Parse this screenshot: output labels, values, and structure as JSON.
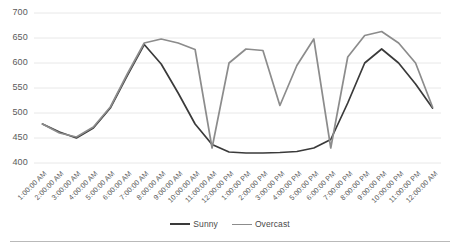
{
  "chart_data": {
    "type": "line",
    "title": "",
    "xlabel": "",
    "ylabel": "",
    "ylim": [
      400,
      700
    ],
    "yticks": [
      400,
      450,
      500,
      550,
      600,
      650,
      700
    ],
    "grid": true,
    "legend_position": "bottom",
    "categories": [
      "1:00:00 AM",
      "2:00:00 AM",
      "3:00:00 AM",
      "4:00:00 AM",
      "5:00:00 AM",
      "6:00:00 AM",
      "7:00:00 AM",
      "8:00:00 AM",
      "9:00:00 AM",
      "10:00:00 AM",
      "11:00:00 AM",
      "12:00:00 PM",
      "1:00:00 PM",
      "2:00:00 PM",
      "3:00:00 PM",
      "4:00:00 PM",
      "5:00:00 PM",
      "6:00:00 PM",
      "7:00:00 PM",
      "8:00:00 PM",
      "9:00:00 PM",
      "10:00:00 PM",
      "11:00:00 PM",
      "12:00:00 AM"
    ],
    "series": [
      {
        "name": "Sunny",
        "color": "#3a3a3a",
        "values": [
          478,
          462,
          450,
          470,
          510,
          575,
          637,
          598,
          540,
          478,
          437,
          422,
          420,
          420,
          421,
          423,
          430,
          447,
          520,
          600,
          628,
          600,
          558,
          510
        ]
      },
      {
        "name": "Overcast",
        "color": "#8c8c8c",
        "values": [
          478,
          460,
          452,
          472,
          512,
          578,
          640,
          648,
          640,
          627,
          430,
          600,
          628,
          625,
          515,
          595,
          648,
          430,
          612,
          655,
          663,
          640,
          600,
          512
        ]
      }
    ]
  },
  "legend": {
    "entries": [
      {
        "label": "Sunny",
        "color": "#3a3a3a"
      },
      {
        "label": "Overcast",
        "color": "#8c8c8c"
      }
    ]
  },
  "axis": {
    "y_tick_labels": [
      "700",
      "650",
      "600",
      "550",
      "500",
      "450",
      "400"
    ],
    "x_tick_labels": [
      "1:00:00 AM",
      "2:00:00 AM",
      "3:00:00 AM",
      "4:00:00 AM",
      "5:00:00 AM",
      "6:00:00 AM",
      "7:00:00 AM",
      "8:00:00 AM",
      "9:00:00 AM",
      "10:00:00 AM",
      "11:00:00 AM",
      "12:00:00 PM",
      "1:00:00 PM",
      "2:00:00 PM",
      "3:00:00 PM",
      "4:00:00 PM",
      "5:00:00 PM",
      "6:00:00 PM",
      "7:00:00 PM",
      "8:00:00 PM",
      "9:00:00 PM",
      "10:00:00 PM",
      "11:00:00 PM",
      "12:00:00 AM"
    ]
  },
  "style": {
    "gridline_color": "#e8e8e8",
    "axis_text_color": "#5a5a5a",
    "rule_color": "#b9b9b9",
    "background": "#ffffff"
  }
}
